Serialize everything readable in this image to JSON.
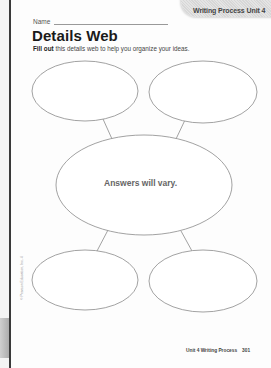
{
  "header": {
    "tab_label": "Writing Process Unit 4",
    "name_label": "Name"
  },
  "worksheet": {
    "title": "Details Web",
    "instructions_bold": "Fill out",
    "instructions_rest": " this details web to help you organize your ideas."
  },
  "web": {
    "center_text": "Answers will vary.",
    "nodes": [
      {
        "id": "top-left",
        "cx": 85,
        "cy": 91,
        "rx": 53,
        "ry": 30
      },
      {
        "id": "top-right",
        "cx": 203,
        "cy": 92,
        "rx": 54,
        "ry": 31
      },
      {
        "id": "center",
        "cx": 144,
        "cy": 185,
        "rx": 88,
        "ry": 50
      },
      {
        "id": "bottom-left",
        "cx": 85,
        "cy": 280,
        "rx": 53,
        "ry": 30
      },
      {
        "id": "bottom-right",
        "cx": 203,
        "cy": 281,
        "rx": 54,
        "ry": 31
      }
    ]
  },
  "side_note": "© Pearson Education, Inc. 4",
  "footer": {
    "unit_label": "Unit 4 Writing Process",
    "page_number": "301"
  },
  "colors": {
    "outline": "#8a8a8a",
    "answer_text": "#666666",
    "tab_fill": "#dcdcdc"
  }
}
